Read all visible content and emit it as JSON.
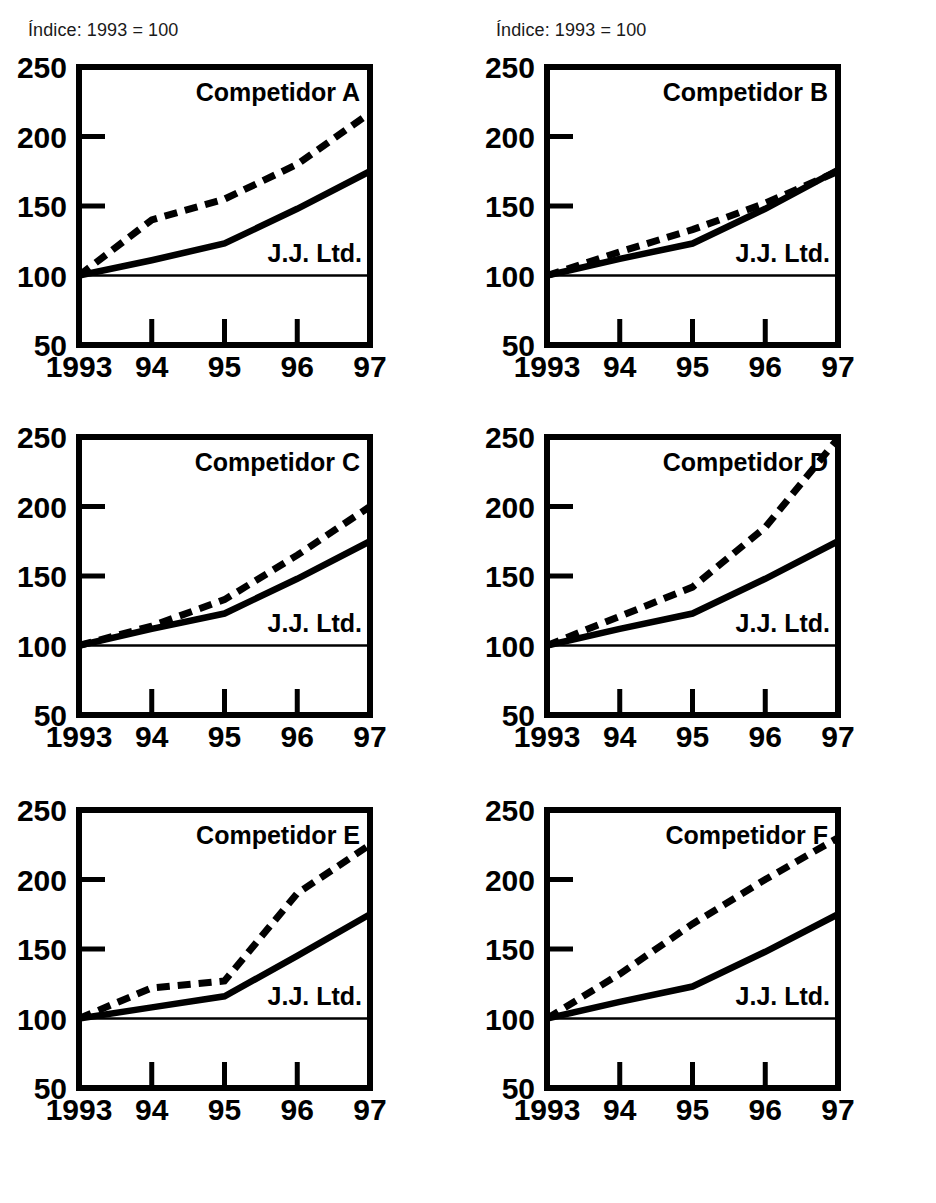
{
  "figure": {
    "index_note_left": "Índice: 1993 = 100",
    "index_note_right": "Índice: 1993 = 100",
    "jj_label": "J.J. Ltd.",
    "y_ticks": [
      "250",
      "200",
      "150",
      "100",
      "50"
    ],
    "x_ticks": [
      "1993",
      "94",
      "95",
      "96",
      "97"
    ],
    "ink_color": "#000000",
    "background_color": "#ffffff"
  },
  "chart_data": [
    {
      "type": "line",
      "title": "Competidor A",
      "xlabel": "",
      "ylabel": "",
      "subtitle": "Índice: 1993 = 100",
      "categories": [
        "1993",
        "94",
        "95",
        "96",
        "97"
      ],
      "x": [
        1993,
        1994,
        1995,
        1996,
        1997
      ],
      "ylim": [
        50,
        250
      ],
      "yticks": [
        50,
        100,
        150,
        200,
        250
      ],
      "grid": false,
      "legend": "inline-labels",
      "series": [
        {
          "name": "Competidor A",
          "style": "dashed",
          "values": [
            100,
            140,
            155,
            180,
            217
          ]
        },
        {
          "name": "J.J. Ltd.",
          "style": "solid",
          "values": [
            100,
            111,
            123,
            148,
            175
          ]
        }
      ]
    },
    {
      "type": "line",
      "title": "Competidor B",
      "xlabel": "",
      "ylabel": "",
      "subtitle": "Índice: 1993 = 100",
      "categories": [
        "1993",
        "94",
        "95",
        "96",
        "97"
      ],
      "x": [
        1993,
        1994,
        1995,
        1996,
        1997
      ],
      "ylim": [
        50,
        250
      ],
      "yticks": [
        50,
        100,
        150,
        200,
        250
      ],
      "grid": false,
      "legend": "inline-labels",
      "series": [
        {
          "name": "Competidor B",
          "style": "dashed",
          "values": [
            100,
            117,
            133,
            152,
            175
          ]
        },
        {
          "name": "J.J. Ltd.",
          "style": "solid",
          "values": [
            100,
            112,
            123,
            148,
            176
          ]
        }
      ]
    },
    {
      "type": "line",
      "title": "Competidor C",
      "xlabel": "",
      "ylabel": "",
      "subtitle": "Índice: 1993 = 100",
      "categories": [
        "1993",
        "94",
        "95",
        "96",
        "97"
      ],
      "x": [
        1993,
        1994,
        1995,
        1996,
        1997
      ],
      "ylim": [
        50,
        250
      ],
      "yticks": [
        50,
        100,
        150,
        200,
        250
      ],
      "grid": false,
      "legend": "inline-labels",
      "series": [
        {
          "name": "Competidor C",
          "style": "dashed",
          "values": [
            100,
            114,
            133,
            165,
            200
          ]
        },
        {
          "name": "J.J. Ltd.",
          "style": "solid",
          "values": [
            100,
            112,
            123,
            148,
            175
          ]
        }
      ]
    },
    {
      "type": "line",
      "title": "Competidor D",
      "xlabel": "",
      "ylabel": "",
      "subtitle": "Índice: 1993 = 100",
      "categories": [
        "1993",
        "94",
        "95",
        "96",
        "97"
      ],
      "x": [
        1993,
        1994,
        1995,
        1996,
        1997
      ],
      "ylim": [
        50,
        250
      ],
      "yticks": [
        50,
        100,
        150,
        200,
        250
      ],
      "grid": false,
      "legend": "inline-labels",
      "series": [
        {
          "name": "Competidor D",
          "style": "dashed",
          "values": [
            100,
            121,
            142,
            185,
            249
          ]
        },
        {
          "name": "J.J. Ltd.",
          "style": "solid",
          "values": [
            100,
            112,
            123,
            148,
            175
          ]
        }
      ]
    },
    {
      "type": "line",
      "title": "Competidor E",
      "xlabel": "",
      "ylabel": "",
      "subtitle": "Índice: 1993 = 100",
      "categories": [
        "1993",
        "94",
        "95",
        "96",
        "97"
      ],
      "x": [
        1993,
        1994,
        1995,
        1996,
        1997
      ],
      "ylim": [
        50,
        250
      ],
      "yticks": [
        50,
        100,
        150,
        200,
        250
      ],
      "grid": false,
      "legend": "inline-labels",
      "series": [
        {
          "name": "Competidor E",
          "style": "dashed",
          "values": [
            100,
            122,
            127,
            190,
            225
          ]
        },
        {
          "name": "J.J. Ltd.",
          "style": "solid",
          "values": [
            100,
            108,
            116,
            145,
            175
          ]
        }
      ]
    },
    {
      "type": "line",
      "title": "Competidor F",
      "xlabel": "",
      "ylabel": "",
      "subtitle": "Índice: 1993 = 100",
      "categories": [
        "1993",
        "94",
        "95",
        "96",
        "97"
      ],
      "x": [
        1993,
        1994,
        1995,
        1996,
        1997
      ],
      "ylim": [
        50,
        250
      ],
      "yticks": [
        50,
        100,
        150,
        200,
        250
      ],
      "grid": false,
      "legend": "inline-labels",
      "series": [
        {
          "name": "Competidor F",
          "style": "dashed",
          "values": [
            100,
            132,
            168,
            200,
            230
          ]
        },
        {
          "name": "J.J. Ltd.",
          "style": "solid",
          "values": [
            100,
            112,
            123,
            148,
            175
          ]
        }
      ]
    }
  ]
}
